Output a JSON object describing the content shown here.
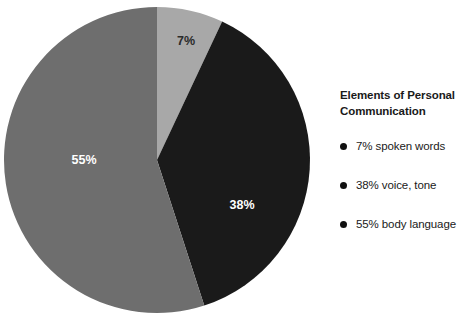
{
  "chart_data": {
    "type": "pie",
    "title": "Elements of Personal Communication",
    "categories": [
      "spoken words",
      "voice, tone",
      "body language"
    ],
    "values": [
      7,
      38,
      55
    ],
    "value_suffix": "%",
    "slice_labels": [
      "7%",
      "38%",
      "55%"
    ],
    "colors": [
      "#a8a8a8",
      "#1a1a1a",
      "#6e6e6e"
    ],
    "label_colors": [
      "#2b2b2b",
      "#ffffff",
      "#ffffff"
    ],
    "start_angle_deg": 0,
    "direction": "clockwise",
    "legend_position": "right",
    "legend_entries": [
      "7% spoken words",
      "38% voice, tone",
      "55% body language"
    ],
    "xlabel": "",
    "ylabel": "",
    "grid": false
  },
  "pie": {
    "center_x": 157,
    "center_y": 160,
    "radius": 153,
    "slices": [
      {
        "name": "spoken-words",
        "label": "7%",
        "value": 7,
        "color": "#a8a8a8",
        "label_color": "#2b2b2b",
        "label_x": 186,
        "label_y": 42
      },
      {
        "name": "voice-tone",
        "label": "38%",
        "value": 38,
        "color": "#1a1a1a",
        "label_color": "#ffffff",
        "label_x": 242,
        "label_y": 206
      },
      {
        "name": "body-language",
        "label": "55%",
        "value": 55,
        "color": "#6e6e6e",
        "label_color": "#ffffff",
        "label_x": 84,
        "label_y": 161
      }
    ]
  },
  "legend": {
    "title": "Elements of Personal\nCommunication",
    "items": [
      {
        "label": "7% spoken words"
      },
      {
        "label": "38% voice, tone"
      },
      {
        "label": "55% body language"
      }
    ]
  }
}
